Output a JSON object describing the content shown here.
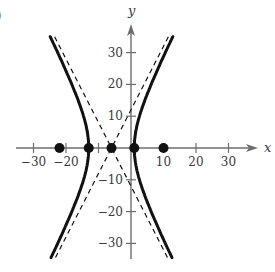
{
  "panel_label": ")",
  "chart_data": {
    "type": "line",
    "title": "",
    "xlabel": "x",
    "ylabel": "y",
    "xlim": [
      -37,
      38
    ],
    "ylim": [
      -34,
      37
    ],
    "grid": false,
    "x_ticks": [
      -30,
      -20,
      -10,
      10,
      20,
      30
    ],
    "x_tick_labels": [
      "−30",
      "−20",
      "",
      "10",
      "20",
      "30"
    ],
    "y_ticks": [
      30,
      20,
      10,
      -10,
      -20,
      -30
    ],
    "y_tick_labels": [
      "30",
      "20",
      "10",
      "−10",
      "−20",
      "−30"
    ],
    "hyperbola": {
      "center": [
        -6,
        0
      ],
      "a": 7,
      "b": 14,
      "orientation": "horizontal",
      "style": "solid thick"
    },
    "asymptotes": [
      {
        "name": "asymptote-1",
        "slope": 2,
        "through": [
          -6,
          0
        ],
        "style": "dashed"
      },
      {
        "name": "asymptote-2",
        "slope": -2,
        "through": [
          -6,
          0
        ],
        "style": "dashed"
      }
    ],
    "points": [
      {
        "label": "focus-left",
        "x": -22,
        "y": 0
      },
      {
        "label": "vertex-left",
        "x": -13,
        "y": 0
      },
      {
        "label": "center",
        "x": -6,
        "y": 0
      },
      {
        "label": "vertex-right",
        "x": 1,
        "y": 0
      },
      {
        "label": "focus-right",
        "x": 10,
        "y": 0
      }
    ],
    "colors": {
      "curve": "#111111",
      "axis": "#6e6e6e",
      "point": "#111111"
    }
  }
}
